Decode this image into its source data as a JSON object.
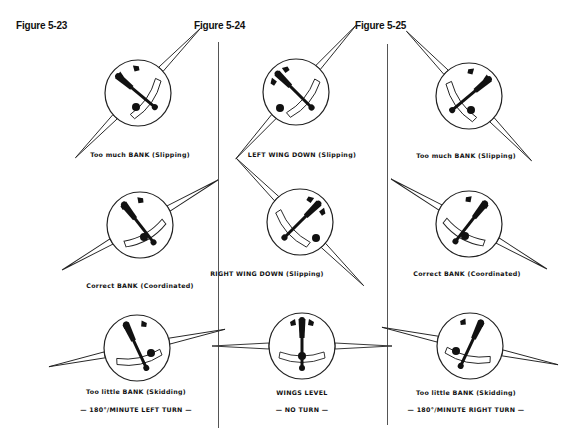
{
  "figures": [
    {
      "title": "Figure 5-23",
      "panels": [
        {
          "caption": "Too much BANK (Slipping)"
        },
        {
          "caption": "Correct BANK (Coordinated)"
        },
        {
          "caption": "Too little BANK (Skidding)"
        }
      ],
      "footer": "— 180°/MINUTE LEFT TURN —"
    },
    {
      "title": "Figure 5-24",
      "panels": [
        {
          "caption": "LEFT WING DOWN (Slipping)"
        },
        {
          "caption": "RIGHT WING DOWN (Slipping)"
        },
        {
          "caption": "WINGS LEVEL"
        }
      ],
      "footer": "— NO TURN —"
    },
    {
      "title": "Figure 5-25",
      "panels": [
        {
          "caption": "Too much BANK (Slipping)"
        },
        {
          "caption": "Correct BANK (Coordinated)"
        },
        {
          "caption": "Too little BANK (Skidding)"
        }
      ],
      "footer": "— 180°/MINUTE RIGHT TURN —"
    }
  ]
}
